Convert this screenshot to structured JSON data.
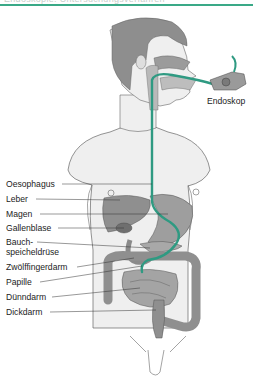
{
  "header": {
    "text": "Endoskopie: Untersuchungsverfahren",
    "accent_color": "#3aa987"
  },
  "figure": {
    "endoscope_label": "Endoskop",
    "labels": [
      {
        "text": "Oesophagus",
        "y": 179
      },
      {
        "text": "Leber",
        "y": 194
      },
      {
        "text": "Magen",
        "y": 209
      },
      {
        "text": "Gallenblase",
        "y": 223
      },
      {
        "text": "Bauch-",
        "y": 237
      },
      {
        "text": "speicheldrüse",
        "y": 247
      },
      {
        "text": "Zwölffingerdarm",
        "y": 262
      },
      {
        "text": "Papille",
        "y": 277
      },
      {
        "text": "Dünndarm",
        "y": 292
      },
      {
        "text": "Dickdarm",
        "y": 307
      }
    ],
    "colors": {
      "skin": "#eeeeee",
      "hair": "#8e8e8e",
      "organ": "#9a9a9a",
      "organ_dark": "#7d7d7d",
      "tube": "#2f9a82",
      "outline": "#555555"
    }
  }
}
